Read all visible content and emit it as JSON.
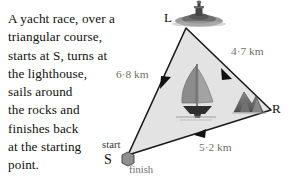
{
  "problem": {
    "lines": [
      "A yacht race, over a",
      "triangular course,",
      "starts at S, turns at",
      "the lighthouse,",
      "sails around",
      "the rocks and",
      "finishes back",
      "at the starting",
      "point."
    ]
  },
  "diagram": {
    "vertices": {
      "lighthouse": "L",
      "rocks": "R",
      "start": "S"
    },
    "annotations": {
      "start": "start",
      "finish": "finish"
    },
    "distances": {
      "start_to_lighthouse": "6·8 km",
      "lighthouse_to_rocks": "4·7 km",
      "rocks_to_start": "5·2 km"
    },
    "icons": {
      "lighthouse": "lighthouse-icon",
      "yacht": "yacht-icon",
      "rocks": "rocks-icon",
      "marker": "hexagon-marker-icon"
    },
    "colors": {
      "course_fill": "#e2e2e2",
      "course_stroke": "#1a1a1a",
      "distance_text": "#6f6f6f",
      "label_text": "#0d0d0d"
    }
  }
}
